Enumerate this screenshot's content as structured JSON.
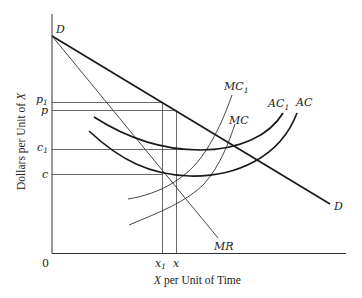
{
  "diagram": {
    "type": "monopoly-cost-shift",
    "axes": {
      "x_title_var": "X",
      "x_title_rest": " per Unit of Time",
      "y_title_pre": "Dollars per Unit of ",
      "y_title_var": "X",
      "origin": "0"
    },
    "y_ticks": [
      {
        "base": "p",
        "sub": "1"
      },
      {
        "base": "p",
        "sub": ""
      },
      {
        "base": "c",
        "sub": "1"
      },
      {
        "base": "c",
        "sub": ""
      }
    ],
    "x_ticks": [
      {
        "base": "x",
        "sub": "1"
      },
      {
        "base": "x",
        "sub": ""
      }
    ],
    "curves": {
      "demand_top": "D",
      "demand_bottom": "D",
      "mr": "MR",
      "mc1_base": "MC",
      "mc1_sub": "1",
      "mc": "MC",
      "ac1_base": "AC",
      "ac1_sub": "1",
      "ac": "AC"
    },
    "colors": {
      "ink": "#222222",
      "background": "#ffffff"
    }
  }
}
